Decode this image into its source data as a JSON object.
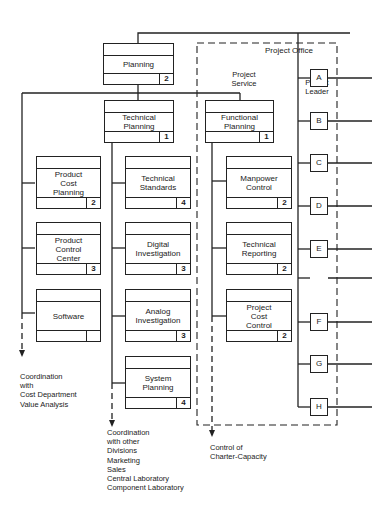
{
  "office": {
    "title": "Project Office",
    "service_label": "Project\nService",
    "leader_label": "Project\nLeader"
  },
  "boxes": {
    "planning": {
      "label": "Planning",
      "num": "2"
    },
    "technical_planning": {
      "label": "Technical\nPlanning",
      "num": "1"
    },
    "functional_planning": {
      "label": "Functional\nPlanning",
      "num": "1"
    },
    "product_cost_planning": {
      "label": "Product\nCost\nPlanning",
      "num": "2"
    },
    "product_control_center": {
      "label": "Product\nControl\nCenter",
      "num": "3"
    },
    "software": {
      "label": "Software",
      "num": ""
    },
    "technical_standards": {
      "label": "Technical\nStandards",
      "num": "4"
    },
    "digital_investigation": {
      "label": "Digital\nInvestigation",
      "num": "3"
    },
    "analog_investigation": {
      "label": "Analog\nInvestigation",
      "num": "3"
    },
    "system_planning": {
      "label": "System\nPlanning",
      "num": "4"
    },
    "manpower_control": {
      "label": "Manpower\nControl",
      "num": "2"
    },
    "technical_reporting": {
      "label": "Technical\nReporting",
      "num": "2"
    },
    "project_cost_control": {
      "label": "Project\nCost\nControl",
      "num": "2"
    }
  },
  "leaders": [
    "A",
    "B",
    "C",
    "D",
    "E",
    "F",
    "G",
    "H"
  ],
  "notes": {
    "left": "Coordination\nwith\nCost Department\nValue Analysis",
    "middle": "Coordination\nwith other\nDivisions\nMarketing\nSales\nCentral Laboratory\nComponent Laboratory",
    "right": "Control of\nCharter-Capacity"
  },
  "colors": {
    "line": "#222222",
    "background": "#ffffff"
  }
}
